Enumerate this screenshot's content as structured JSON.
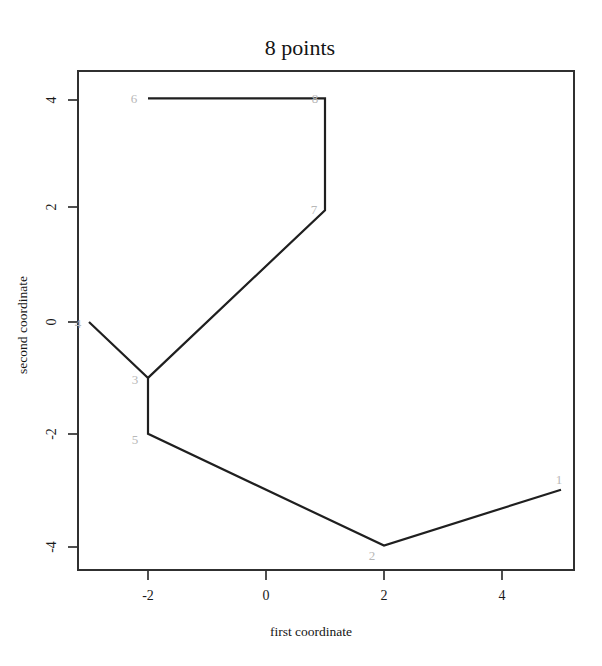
{
  "chart_data": {
    "type": "line",
    "title": "8 points",
    "xlabel": "first coordinate",
    "ylabel": "second coordinate",
    "xlim": [
      -3.4,
      5.4
    ],
    "ylim": [
      -4.45,
      4.45
    ],
    "xticks": [
      -2,
      0,
      2,
      4
    ],
    "xtick_labels": [
      "-2",
      "0",
      "2",
      "4"
    ],
    "yticks": [
      4,
      2,
      0,
      -2,
      -4
    ],
    "ytick_labels": [
      "4",
      "2",
      "0",
      "-2",
      "-4"
    ],
    "grid": false,
    "legend": "none",
    "line_color": "#1f1f1f",
    "label_color": "#b8b8b8",
    "frame_color": "#303030",
    "points": [
      {
        "id": "1",
        "label": "1",
        "x": 5,
        "y": -3
      },
      {
        "id": "2",
        "label": "2",
        "x": 2,
        "y": -4
      },
      {
        "id": "3",
        "label": "3",
        "x": -2,
        "y": -1
      },
      {
        "id": "4",
        "label": "4",
        "x": -3,
        "y": 0
      },
      {
        "id": "5",
        "label": "5",
        "x": -2,
        "y": -2
      },
      {
        "id": "6",
        "label": "6",
        "x": -2,
        "y": 4
      },
      {
        "id": "7",
        "label": "7",
        "x": 1,
        "y": 2
      },
      {
        "id": "8",
        "label": "8",
        "x": 1,
        "y": 4
      }
    ],
    "edges": [
      [
        "1",
        "2"
      ],
      [
        "2",
        "5"
      ],
      [
        "5",
        "3"
      ],
      [
        "3",
        "4"
      ],
      [
        "3",
        "7"
      ],
      [
        "7",
        "8"
      ],
      [
        "8",
        "6"
      ]
    ],
    "path_order": [
      "4",
      "3",
      "5",
      "2",
      "1"
    ],
    "branch_order": [
      "3",
      "7",
      "8",
      "6"
    ]
  }
}
